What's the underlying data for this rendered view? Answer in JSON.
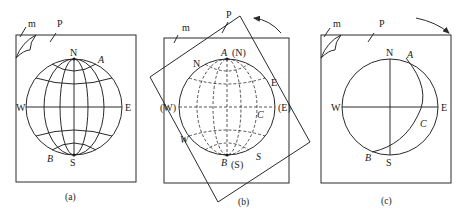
{
  "diagram": {
    "panels": [
      {
        "id": "a",
        "caption": "(a)",
        "labels": {
          "m": "m",
          "P": "P",
          "N": "N",
          "S": "S",
          "W": "W",
          "E": "E",
          "A": "A",
          "B": "B"
        },
        "net_style": "solid"
      },
      {
        "id": "b",
        "caption": "(b)",
        "labels": {
          "m": "m",
          "P": "P",
          "A_N": "A",
          "N_paren": "(N)",
          "B_S": "B",
          "S_paren": "(S)",
          "W_paren": "(W)",
          "E_paren": "(E)",
          "N_rot": "N",
          "E_rot": "E",
          "W_rot": "W",
          "S_rot": "S",
          "C": "C"
        },
        "rotation": "counter-clockwise",
        "net_style": "dashed"
      },
      {
        "id": "c",
        "caption": "(c)",
        "labels": {
          "m": "m",
          "P": "P",
          "N": "N",
          "S": "S",
          "W": "W",
          "E": "E",
          "A": "A",
          "B": "B",
          "C": "C"
        },
        "rotation": "clockwise"
      }
    ]
  }
}
